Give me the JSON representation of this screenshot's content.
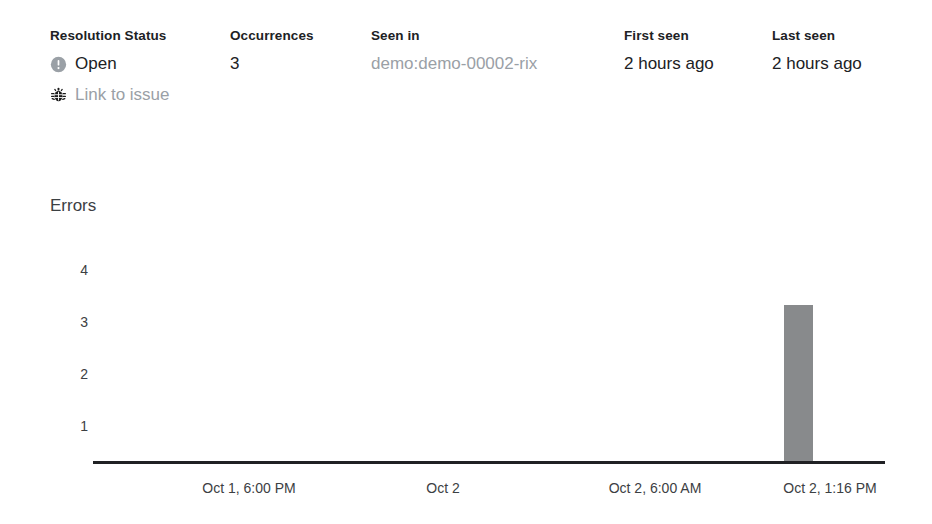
{
  "summary": {
    "columns": [
      {
        "label": "Resolution Status",
        "status_icon": "circle-exclamation-icon",
        "status_value": "Open",
        "link_icon": "bug-icon",
        "link_label": "Link to issue"
      },
      {
        "label": "Occurrences",
        "value": "3"
      },
      {
        "label": "Seen in",
        "value": "demo:demo-00002-rix"
      },
      {
        "label": "First seen",
        "value": "2 hours ago"
      },
      {
        "label": "Last seen",
        "value": "2 hours ago"
      }
    ]
  },
  "chart": {
    "title": "Errors"
  },
  "colors": {
    "bar": "#888a8c",
    "axis": "#202124",
    "text": "#202124",
    "muted_text": "#9aa0a6"
  },
  "chart_data": {
    "type": "bar",
    "title": "Errors",
    "xlabel": "",
    "ylabel": "Errors",
    "categories": [
      "Oct 1, 6:00 PM",
      "Oct 2",
      "Oct 2, 6:00 AM",
      "Oct 2, 1:16 PM"
    ],
    "x_tick_labels": [
      "Oct 1, 6:00 PM",
      "Oct 2",
      "Oct 2, 6:00 AM",
      "Oct 2, 1:16 PM"
    ],
    "y_tick_labels": [
      "1",
      "2",
      "3",
      "4"
    ],
    "yticks": [
      1,
      2,
      3,
      4
    ],
    "ylim": [
      0,
      4.4
    ],
    "grid": false,
    "legend": null,
    "values": [
      0,
      0,
      0,
      3
    ],
    "bars": [
      {
        "label": "Oct 2, 1:16 PM",
        "value": 3
      }
    ]
  }
}
